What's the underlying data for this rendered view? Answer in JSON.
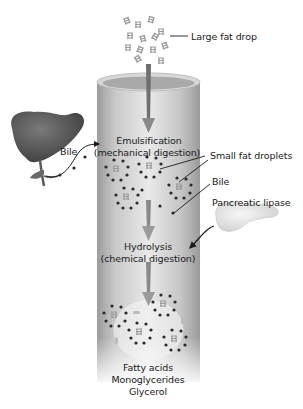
{
  "diagram": {
    "labels": {
      "large_fat_drop": "Large fat drop",
      "bile_left": "Bile",
      "emulsification_line1": "Emulsification",
      "emulsification_line2": "(mechanical digestion)",
      "small_fat_droplets": "Small fat droplets",
      "bile_right": "Bile",
      "pancreatic_lipase": "Pancreatic lipase",
      "hydrolysis_line1": "Hydrolysis",
      "hydrolysis_line2": "(chemical digestion)",
      "product_1": "Fatty acids",
      "product_2": "Monoglycerides",
      "product_3": "Glycerol"
    },
    "organs": [
      "liver",
      "pancreas",
      "small-intestine-tube"
    ],
    "colors": {
      "tube_light": "#e6e6e6",
      "tube_dark": "#9a9a9a",
      "liver": "#5a5a5a",
      "pancreas": "#e8e8e8",
      "arrow": "#7a7a7a",
      "bile_dots": "#2a2a2a"
    }
  }
}
